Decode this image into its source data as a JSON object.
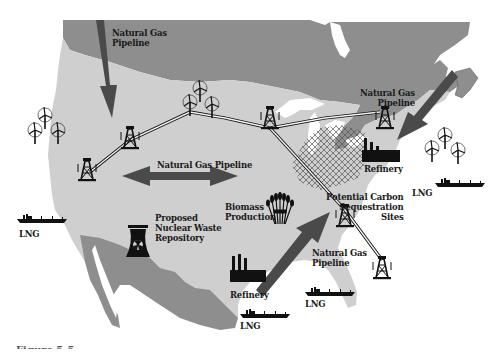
{
  "map": {
    "title": "North America energy infrastructure",
    "colors": {
      "background": "#ffffff",
      "canada": "#8e8e8e",
      "usa": "#cfcfcf",
      "mexico": "#8e8e8e",
      "water": "#ffffff",
      "arrow": "#4a4a4a",
      "icon": "#111111"
    },
    "labels": {
      "pipeline_nw": [
        "Natural Gas",
        "Pipeline"
      ],
      "pipeline_center": [
        "Natural Gas Pipeline"
      ],
      "pipeline_ne": [
        "Natural Gas",
        "Pipeline"
      ],
      "pipeline_se": [
        "Natural Gas",
        "Pipeline"
      ],
      "biomass": [
        "Biomass",
        "Production"
      ],
      "nuclear": [
        "Proposed",
        "Nuclear Waste",
        "Repository"
      ],
      "refinery_ne": [
        "Refinery"
      ],
      "refinery_south": [
        "Refinery"
      ],
      "carbon": [
        "Potential Carbon",
        "Sequestration",
        "Sites"
      ],
      "lng_west": [
        "LNG"
      ],
      "lng_east": [
        "LNG"
      ],
      "lng_gulf_east": [
        "LNG"
      ],
      "lng_gulf_west": [
        "LNG"
      ]
    },
    "icons": [
      {
        "type": "wind-turbine-cluster",
        "location": "west-coast"
      },
      {
        "type": "wind-turbine-cluster",
        "location": "north-central"
      },
      {
        "type": "wind-turbine-cluster",
        "location": "northeast-coast"
      },
      {
        "type": "oil-derrick",
        "location": "southwest"
      },
      {
        "type": "oil-derrick",
        "location": "northwest"
      },
      {
        "type": "oil-derrick",
        "location": "central"
      },
      {
        "type": "oil-derrick",
        "location": "great-lakes"
      },
      {
        "type": "oil-derrick",
        "location": "southeast"
      },
      {
        "type": "oil-derrick",
        "location": "florida"
      },
      {
        "type": "nuclear-repository",
        "location": "southwest"
      },
      {
        "type": "biomass-wheat",
        "location": "central"
      },
      {
        "type": "refinery",
        "location": "northeast"
      },
      {
        "type": "refinery",
        "location": "gulf"
      },
      {
        "type": "lng-tanker",
        "location": "pacific"
      },
      {
        "type": "lng-tanker",
        "location": "atlantic"
      },
      {
        "type": "lng-tanker",
        "location": "gulf-east"
      },
      {
        "type": "lng-tanker",
        "location": "gulf-west"
      }
    ]
  },
  "caption": "Figure 5-5"
}
